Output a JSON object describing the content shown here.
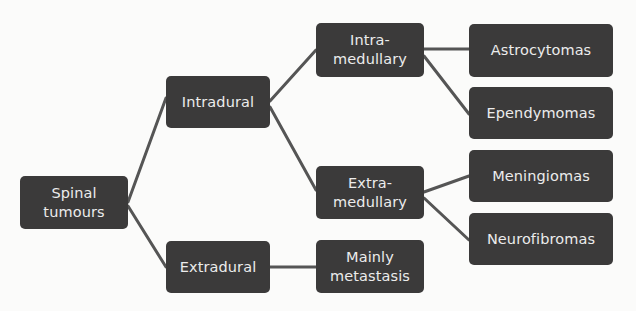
{
  "diagram": {
    "line_color": "#555555",
    "node_color": "#3b3a3a",
    "text_color": "#ececec",
    "nodes": {
      "spinal_tumours": "Spinal\ntumours",
      "intradural": "Intradural",
      "extradural": "Extradural",
      "intramedullary": "Intra-\nmedullary",
      "extramedullary": "Extra-\nmedullary",
      "mainly_metastasis": "Mainly\nmetastasis",
      "astrocytomas": "Astrocytomas",
      "ependymomas": "Ependymomas",
      "meningiomas": "Meningiomas",
      "neurofibromas": "Neurofibromas"
    },
    "edges": [
      [
        "Spinal tumours",
        "Intradural"
      ],
      [
        "Spinal tumours",
        "Extradural"
      ],
      [
        "Intradural",
        "Intra-medullary"
      ],
      [
        "Intradural",
        "Extra-medullary"
      ],
      [
        "Extradural",
        "Mainly metastasis"
      ],
      [
        "Intra-medullary",
        "Astrocytomas"
      ],
      [
        "Intra-medullary",
        "Ependymomas"
      ],
      [
        "Extra-medullary",
        "Meningiomas"
      ],
      [
        "Extra-medullary",
        "Neurofibromas"
      ]
    ]
  }
}
